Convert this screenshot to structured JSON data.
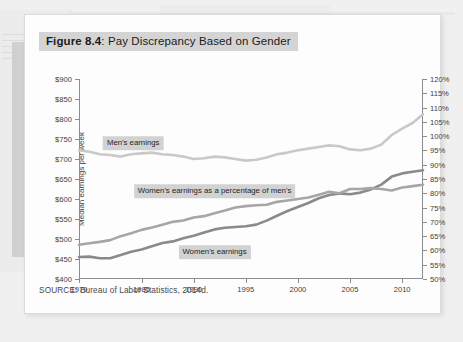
{
  "figure": {
    "label": "Figure 8.4",
    "title_prefix": "Figure 8.4",
    "title_rest": ": Pay Discrepancy Based on Gender",
    "source": "SOURCE: Bureau of Labor Statistics, 2014d."
  },
  "colors": {
    "mens_line": "#c9c9c9",
    "percentage_line": "#a6a6a6",
    "womens_line": "#8a8a8a",
    "axis": "#8d8d8d",
    "title_highlight": "#d4d4d4",
    "label_highlight": "#d2d2d2",
    "card_background": "#fdfdfd",
    "page_background": "#f0f0f0"
  },
  "chart_data": {
    "type": "line",
    "title": "Figure 8.4: Pay Discrepancy Based on Gender",
    "xlabel": "",
    "ylabel": "Median earnings per week",
    "y2label": "",
    "grid": false,
    "legend": "inline-labels",
    "xlim": [
      1979,
      2012
    ],
    "ylim": [
      400,
      900
    ],
    "y2lim": [
      50,
      120
    ],
    "ytick_labels": [
      "$900",
      "$850",
      "$800",
      "$750",
      "$700",
      "$650",
      "$600",
      "$550",
      "$500",
      "$450",
      "$400"
    ],
    "ytick_values": [
      900,
      850,
      800,
      750,
      700,
      650,
      600,
      550,
      500,
      450,
      400
    ],
    "y2tick_labels": [
      "120%",
      "115%",
      "110%",
      "105%",
      "100%",
      "95%",
      "90%",
      "85%",
      "80%",
      "75%",
      "70%",
      "65%",
      "60%",
      "55%",
      "50%"
    ],
    "y2tick_values": [
      120,
      115,
      110,
      105,
      100,
      95,
      90,
      85,
      80,
      75,
      70,
      65,
      60,
      55,
      50
    ],
    "xtick_labels": [
      "1979",
      "1985",
      "1990",
      "1995",
      "2000",
      "2005",
      "2010"
    ],
    "xtick_values": [
      1979,
      1985,
      1990,
      1995,
      2000,
      2005,
      2010
    ],
    "x": [
      1979,
      1980,
      1981,
      1982,
      1983,
      1984,
      1985,
      1986,
      1987,
      1988,
      1989,
      1990,
      1991,
      1992,
      1993,
      1994,
      1995,
      1996,
      1997,
      1998,
      1999,
      2000,
      2001,
      2002,
      2003,
      2004,
      2005,
      2006,
      2007,
      2008,
      2009,
      2010,
      2011,
      2012
    ],
    "series": [
      {
        "name": "Men's earnings",
        "axis": "left",
        "color": "#c9c9c9",
        "units": "dollars per week",
        "values": [
          722,
          718,
          712,
          710,
          706,
          712,
          714,
          716,
          712,
          710,
          706,
          700,
          702,
          706,
          704,
          700,
          696,
          698,
          704,
          712,
          716,
          722,
          726,
          730,
          734,
          732,
          724,
          722,
          726,
          736,
          760,
          776,
          790,
          812
        ]
      },
      {
        "name": "Women's earnings",
        "axis": "left",
        "color": "#8a8a8a",
        "units": "dollars per week",
        "values": [
          455,
          456,
          452,
          452,
          460,
          468,
          474,
          482,
          490,
          494,
          502,
          508,
          516,
          524,
          528,
          530,
          532,
          536,
          546,
          558,
          570,
          580,
          590,
          602,
          610,
          614,
          612,
          616,
          624,
          636,
          656,
          664,
          668,
          672
        ]
      },
      {
        "name": "Women's earnings as a percentage of men's",
        "axis": "right",
        "color": "#a6a6a6",
        "units": "percent",
        "values": [
          62.0,
          62.5,
          63.0,
          63.6,
          65.0,
          66.0,
          67.2,
          68.0,
          69.0,
          70.0,
          70.5,
          71.5,
          72.0,
          73.0,
          74.0,
          75.0,
          75.5,
          75.8,
          76.0,
          77.0,
          77.5,
          78.0,
          78.5,
          79.5,
          80.5,
          80.0,
          81.5,
          81.5,
          81.8,
          81.5,
          81.0,
          82.0,
          82.5,
          83.0
        ]
      }
    ],
    "annotations": [
      {
        "text": "Men's earnings",
        "series": "Men's earnings",
        "at_x": 1984.2,
        "at_y_px": 128
      },
      {
        "text": "Women's earnings as a percentage of men's",
        "series": "Women's earnings as a percentage of men's",
        "at_x": 1992.0,
        "at_y_px": 176
      },
      {
        "text": "Women's earnings",
        "series": "Women's earnings",
        "at_x": 1992.0,
        "at_y_px": 237
      }
    ]
  }
}
